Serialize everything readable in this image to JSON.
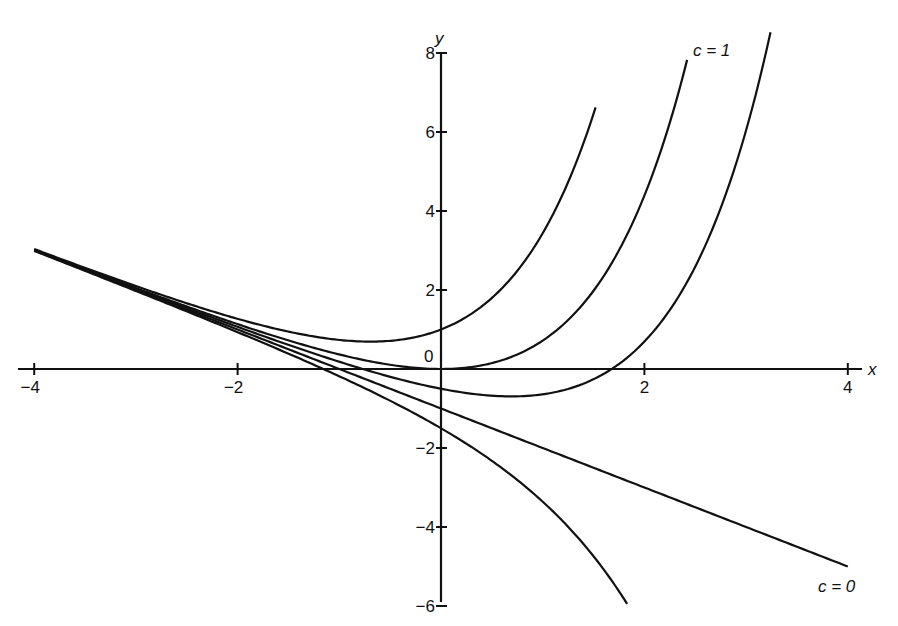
{
  "chart_data": {
    "type": "line",
    "title": "",
    "xlabel": "x",
    "ylabel": "y",
    "xlim": [
      -4,
      4
    ],
    "ylim": [
      -6,
      8
    ],
    "x_ticks": [
      -4,
      -2,
      2,
      4
    ],
    "x_tick_labels": [
      "−4",
      "−2",
      "2",
      "4"
    ],
    "y_ticks": [
      8,
      6,
      4,
      2,
      -2,
      -4,
      -6
    ],
    "y_tick_labels": [
      "8",
      "6",
      "4",
      "2",
      "−2",
      "−4",
      "−6"
    ],
    "origin_label": "0",
    "grid": false,
    "legend": null,
    "function_family": "y = c*e^x - x - 1",
    "series": [
      {
        "name": "c = 2",
        "c": 2,
        "x_range": [
          -4,
          1.52
        ]
      },
      {
        "name": "c = 1",
        "c": 1,
        "x_range": [
          -4,
          2.42
        ],
        "label": "c = 1"
      },
      {
        "name": "c = 0.5",
        "c": 0.5,
        "x_range": [
          -4,
          3.24
        ]
      },
      {
        "name": "c = 0",
        "c": 0,
        "x_range": [
          -4,
          4
        ],
        "label": "c = 0"
      },
      {
        "name": "c = -0.5",
        "c": -0.5,
        "x_range": [
          -4,
          1.83
        ]
      }
    ],
    "annotations": [
      {
        "text": "c = 1",
        "x": 2.45,
        "y": 8
      },
      {
        "text": "c = 0",
        "x": 3.7,
        "y": -5.6
      }
    ]
  },
  "labels": {
    "x_axis": "x",
    "y_axis": "y",
    "origin": "0",
    "c1": "c = 1",
    "c0": "c = 0"
  }
}
